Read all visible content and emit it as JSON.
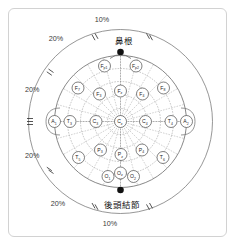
{
  "figure": {
    "type": "eeg-1020-electrode-placement",
    "title": "",
    "background_color": "#ffffff",
    "frame_color": "#d2d2d2"
  },
  "landmarks": {
    "nasion": {
      "label": "鼻根",
      "marker": "filled-dot",
      "position": "top"
    },
    "inion": {
      "label": "後頭結節",
      "marker": "filled-dot",
      "position": "bottom"
    }
  },
  "measurements": [
    {
      "id": "top-10",
      "text": "10%",
      "position": "top-center"
    },
    {
      "id": "upper-left-20",
      "text": "20%",
      "position": "upper-left"
    },
    {
      "id": "mid-left-20",
      "text": "20%",
      "position": "mid-left"
    },
    {
      "id": "lower-left-20",
      "text": "20%",
      "position": "lower-left"
    },
    {
      "id": "bottom-left-20",
      "text": "20%",
      "position": "bottom-left"
    },
    {
      "id": "bottom-10",
      "text": "10%",
      "position": "bottom-center"
    }
  ],
  "electrodes": [
    {
      "id": "Fp1",
      "base": "F",
      "sub": "p1",
      "x": 104.5,
      "y": 66.0,
      "row": "prefrontal"
    },
    {
      "id": "Fp2",
      "base": "F",
      "sub": "p2",
      "x": 136.0,
      "y": 66.0,
      "row": "prefrontal"
    },
    {
      "id": "F7",
      "base": "F",
      "sub": "7",
      "x": 78.0,
      "y": 88.0,
      "row": "frontal"
    },
    {
      "id": "F3",
      "base": "F",
      "sub": "3",
      "x": 99.5,
      "y": 94.0,
      "row": "frontal"
    },
    {
      "id": "Fz",
      "base": "F",
      "sub": "z",
      "x": 120.5,
      "y": 91.0,
      "row": "frontal"
    },
    {
      "id": "F4",
      "base": "F",
      "sub": "4",
      "x": 142.5,
      "y": 94.0,
      "row": "frontal"
    },
    {
      "id": "F8",
      "base": "F",
      "sub": "8",
      "x": 163.5,
      "y": 88.0,
      "row": "frontal"
    },
    {
      "id": "A1",
      "base": "A",
      "sub": "1",
      "x": 54.5,
      "y": 121.5,
      "row": "ear"
    },
    {
      "id": "T3",
      "base": "T",
      "sub": "3",
      "x": 70.0,
      "y": 121.5,
      "row": "temporal"
    },
    {
      "id": "C3",
      "base": "C",
      "sub": "3",
      "x": 96.0,
      "y": 121.5,
      "row": "central"
    },
    {
      "id": "Cz",
      "base": "C",
      "sub": "z",
      "x": 120.5,
      "y": 121.5,
      "row": "central"
    },
    {
      "id": "C4",
      "base": "C",
      "sub": "4",
      "x": 145.5,
      "y": 121.5,
      "row": "central"
    },
    {
      "id": "T4",
      "base": "T",
      "sub": "4",
      "x": 171.0,
      "y": 121.5,
      "row": "temporal"
    },
    {
      "id": "A2",
      "base": "A",
      "sub": "2",
      "x": 186.5,
      "y": 121.5,
      "row": "ear"
    },
    {
      "id": "P3",
      "base": "P",
      "sub": "3",
      "x": 100.5,
      "y": 150.0,
      "row": "parietal"
    },
    {
      "id": "Pz",
      "base": "P",
      "sub": "z",
      "x": 121.0,
      "y": 154.5,
      "row": "parietal"
    },
    {
      "id": "P4",
      "base": "P",
      "sub": "4",
      "x": 142.0,
      "y": 150.0,
      "row": "parietal"
    },
    {
      "id": "T5",
      "base": "T",
      "sub": "5",
      "x": 78.5,
      "y": 157.5,
      "row": "temporal"
    },
    {
      "id": "T6",
      "base": "T",
      "sub": "6",
      "x": 163.0,
      "y": 157.5,
      "row": "temporal"
    },
    {
      "id": "O1",
      "base": "O",
      "sub": "1",
      "x": 108.0,
      "y": 176.5,
      "row": "occipital"
    },
    {
      "id": "Oz",
      "base": "O",
      "sub": "z",
      "x": 120.5,
      "y": 173.0,
      "row": "occipital-mid"
    },
    {
      "id": "O2",
      "base": "O",
      "sub": "2",
      "x": 133.5,
      "y": 176.5,
      "row": "occipital"
    }
  ],
  "geometry": {
    "center_x": 120.5,
    "center_y": 121.5,
    "outer_radius": 92,
    "head_radius": 66,
    "ring_radii": [
      13,
      26.5,
      40,
      53,
      66
    ],
    "spoke_count": 24
  }
}
